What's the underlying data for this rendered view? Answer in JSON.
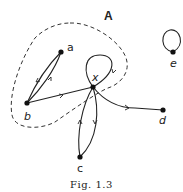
{
  "figure": {
    "caption": "Fig. 1.3",
    "set_label": "A",
    "nodes": [
      {
        "id": "a",
        "label": "a"
      },
      {
        "id": "b",
        "label": "b"
      },
      {
        "id": "x",
        "label": "x"
      },
      {
        "id": "c",
        "label": "c"
      },
      {
        "id": "d",
        "label": "d"
      },
      {
        "id": "e",
        "label": "e"
      }
    ],
    "edges": [
      {
        "from": "a",
        "to": "b"
      },
      {
        "from": "b",
        "to": "a"
      },
      {
        "from": "b",
        "to": "x"
      },
      {
        "from": "x",
        "to": "x"
      },
      {
        "from": "x",
        "to": "c"
      },
      {
        "from": "c",
        "to": "x"
      },
      {
        "from": "x",
        "to": "d"
      },
      {
        "from": "e",
        "to": "e"
      }
    ]
  }
}
